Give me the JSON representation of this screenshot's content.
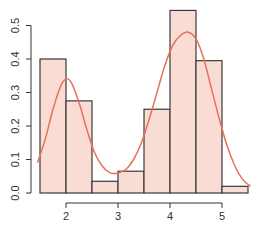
{
  "chart_data": {
    "type": "bar",
    "subtype": "histogram_with_density",
    "title": "",
    "xlabel": "",
    "ylabel": "",
    "bin_edges": [
      1.5,
      2.0,
      2.5,
      3.0,
      3.5,
      4.0,
      4.5,
      5.0,
      5.5
    ],
    "categories": [
      "1.5-2.0",
      "2.0-2.5",
      "2.5-3.0",
      "3.0-3.5",
      "3.5-4.0",
      "4.0-4.5",
      "4.5-5.0",
      "5.0-5.5"
    ],
    "values": [
      0.4,
      0.275,
      0.035,
      0.065,
      0.25,
      0.545,
      0.395,
      0.02
    ],
    "density_curve": {
      "color": "#e8705a",
      "x": [
        1.45,
        1.6,
        1.75,
        1.9,
        2.0,
        2.1,
        2.25,
        2.4,
        2.55,
        2.7,
        2.85,
        3.0,
        3.15,
        3.3,
        3.45,
        3.6,
        3.75,
        3.9,
        4.05,
        4.2,
        4.35,
        4.5,
        4.65,
        4.8,
        4.95,
        5.1,
        5.25,
        5.4,
        5.55
      ],
      "y": [
        0.09,
        0.16,
        0.25,
        0.32,
        0.34,
        0.33,
        0.27,
        0.19,
        0.12,
        0.08,
        0.06,
        0.06,
        0.07,
        0.1,
        0.15,
        0.22,
        0.3,
        0.38,
        0.44,
        0.47,
        0.48,
        0.46,
        0.4,
        0.31,
        0.22,
        0.14,
        0.08,
        0.04,
        0.02
      ]
    },
    "bar_fill": "#f9dcd4",
    "bar_stroke": "#3a3a3a",
    "xticks": [
      2,
      3,
      4,
      5
    ],
    "yticks": [
      0.0,
      0.1,
      0.2,
      0.3,
      0.4,
      0.5
    ],
    "xlim": [
      1.4,
      5.6
    ],
    "ylim": [
      0,
      0.56
    ],
    "grid": false,
    "legend": null
  }
}
